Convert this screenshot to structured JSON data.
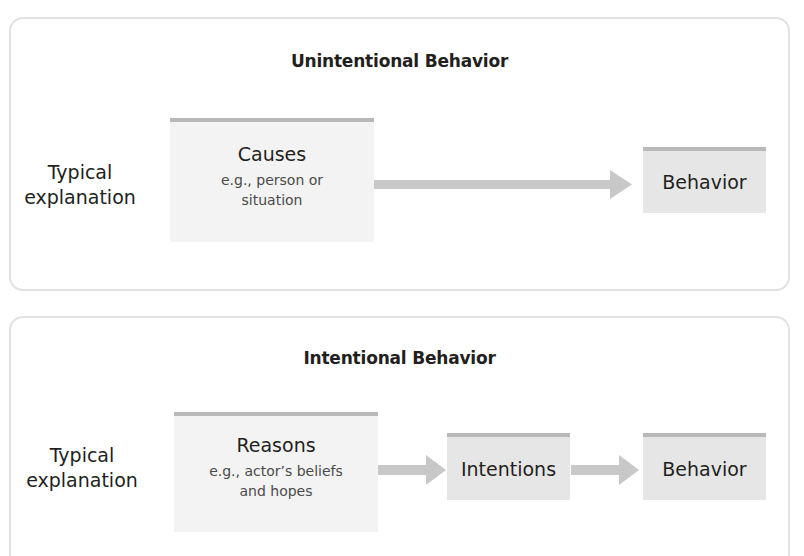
{
  "colors": {
    "panel_border": "#e2e2e2",
    "box_light": "#f3f3f3",
    "box_medium": "#e6e6e6",
    "box_top_border": "#b9b9b9",
    "arrow": "#c8c8c8",
    "text": "#231f20",
    "subtext": "#4a4a4a"
  },
  "unintentional": {
    "title": "Unintentional Behavior",
    "row_label_line1": "Typical",
    "row_label_line2": "explanation",
    "causes": {
      "heading": "Causes",
      "sub_line1": "e.g., person or",
      "sub_line2": "situation"
    },
    "arrow_icon": "arrow-right",
    "behavior": "Behavior"
  },
  "intentional": {
    "title": "Intentional Behavior",
    "row_label_line1": "Typical",
    "row_label_line2": "explanation",
    "reasons": {
      "heading": "Reasons",
      "sub_line1": "e.g., actor’s beliefs",
      "sub_line2": "and hopes"
    },
    "arrow_icon": "arrow-right",
    "intentions": "Intentions",
    "behavior": "Behavior"
  }
}
